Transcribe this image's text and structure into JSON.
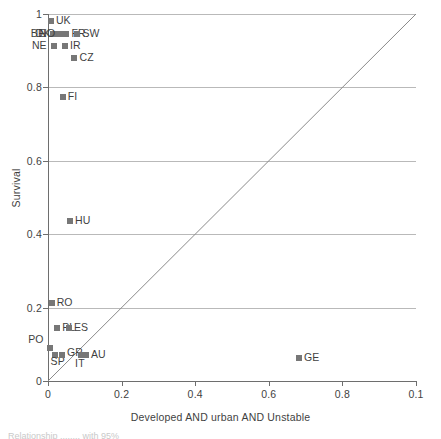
{
  "chart_data": {
    "type": "scatter",
    "title": "",
    "xlabel": "Developed AND urban AND Unstable",
    "ylabel": "Survival",
    "xlim": [
      0,
      1
    ],
    "ylim": [
      0,
      1
    ],
    "xticks": [
      "0",
      "0.2",
      "0.4",
      "0.6",
      "0.8",
      "0.1"
    ],
    "xtick_values": [
      0,
      0.2,
      0.4,
      0.6,
      0.8,
      1.0
    ],
    "yticks": [
      "0",
      "0.2",
      "0.4",
      "0.6",
      "0.8",
      "1"
    ],
    "ytick_values": [
      0,
      0.2,
      0.4,
      0.6,
      0.8,
      1.0
    ],
    "grid": "horizontal",
    "legend": "none",
    "reference_line": {
      "name": "diagonal-identity-line",
      "from": [
        0,
        0
      ],
      "to": [
        1,
        1
      ]
    },
    "marker_color": "#777777",
    "points": [
      {
        "label": "UK",
        "x": 0.008,
        "y": 0.982,
        "label_dx": 5,
        "label_dy": -1
      },
      {
        "label": "BE",
        "x": 0.013,
        "y": 0.945,
        "label_dx": -22,
        "label_dy": -1
      },
      {
        "label": "DK",
        "x": 0.026,
        "y": 0.945,
        "label_dx": -22,
        "label_dy": -1
      },
      {
        "label": "NO",
        "x": 0.036,
        "y": 0.945,
        "label_dx": -22,
        "label_dy": -1
      },
      {
        "label": "FR",
        "x": 0.05,
        "y": 0.945,
        "label_dx": 5,
        "label_dy": -1
      },
      {
        "label": "SW",
        "x": 0.08,
        "y": 0.945,
        "label_dx": 5,
        "label_dy": -1
      },
      {
        "label": "NE",
        "x": 0.016,
        "y": 0.912,
        "label_dx": -22,
        "label_dy": -1
      },
      {
        "label": "IR",
        "x": 0.046,
        "y": 0.912,
        "label_dx": 5,
        "label_dy": -1
      },
      {
        "label": "CZ",
        "x": 0.072,
        "y": 0.88,
        "label_dx": 5,
        "label_dy": -1
      },
      {
        "label": "FI",
        "x": 0.04,
        "y": 0.775,
        "label_dx": 5,
        "label_dy": -1
      },
      {
        "label": "HU",
        "x": 0.06,
        "y": 0.436,
        "label_dx": 5,
        "label_dy": -1
      },
      {
        "label": "RO",
        "x": 0.01,
        "y": 0.213,
        "label_dx": 5,
        "label_dy": -1
      },
      {
        "label": "PL",
        "x": 0.025,
        "y": 0.145,
        "label_dx": 5,
        "label_dy": -1
      },
      {
        "label": "ES",
        "x": 0.057,
        "y": 0.145,
        "label_dx": 5,
        "label_dy": -1
      },
      {
        "label": "PO",
        "x": 0.006,
        "y": 0.09,
        "label_dx": -22,
        "label_dy": -9
      },
      {
        "label": "SP",
        "x": 0.018,
        "y": 0.072,
        "label_dx": -4,
        "label_dy": 6
      },
      {
        "label": "GR",
        "x": 0.038,
        "y": 0.072,
        "label_dx": 5,
        "label_dy": -3
      },
      {
        "label": "IT",
        "x": 0.09,
        "y": 0.072,
        "label_dx": -6,
        "label_dy": 8
      },
      {
        "label": "AU",
        "x": 0.103,
        "y": 0.072,
        "label_dx": 5,
        "label_dy": -1
      },
      {
        "label": "GE",
        "x": 0.682,
        "y": 0.062,
        "label_dx": 5,
        "label_dy": -1
      }
    ]
  },
  "caption_sliver": "Relationship ........ with 95%"
}
